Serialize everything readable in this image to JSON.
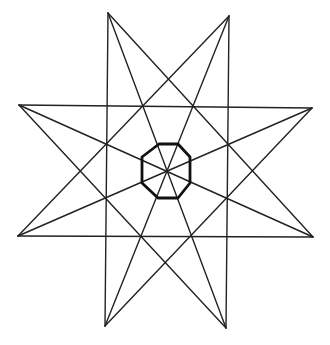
{
  "diagram": {
    "colors": {
      "line": "#222222",
      "octagon": "#111111",
      "background": "#ffffff"
    },
    "tips": [
      {
        "name": "top-left",
        "x": 108,
        "y": 13
      },
      {
        "name": "top-right",
        "x": 229,
        "y": 16
      },
      {
        "name": "right-top",
        "x": 312,
        "y": 108
      },
      {
        "name": "right-bottom",
        "x": 313,
        "y": 237
      },
      {
        "name": "bottom-right",
        "x": 226,
        "y": 328
      },
      {
        "name": "bottom-left",
        "x": 105,
        "y": 326
      },
      {
        "name": "left-bottom",
        "x": 18,
        "y": 236
      },
      {
        "name": "left-top",
        "x": 19,
        "y": 105
      }
    ],
    "lines": [
      [
        0,
        3
      ],
      [
        1,
        4
      ],
      [
        2,
        5
      ],
      [
        3,
        6
      ],
      [
        4,
        7
      ],
      [
        5,
        0
      ],
      [
        6,
        1
      ],
      [
        7,
        2
      ],
      [
        0,
        4
      ],
      [
        1,
        5
      ],
      [
        2,
        6
      ],
      [
        3,
        7
      ]
    ],
    "octagon": [
      [
        159,
        144
      ],
      [
        178,
        144
      ],
      [
        190,
        157
      ],
      [
        190,
        183
      ],
      [
        178,
        198
      ],
      [
        158,
        198
      ],
      [
        142,
        183
      ],
      [
        142,
        157
      ]
    ]
  }
}
